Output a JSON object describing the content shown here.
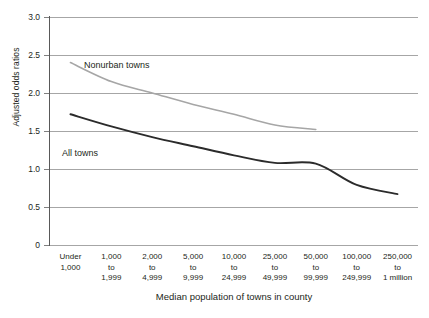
{
  "chart_data": {
    "type": "line",
    "title": "",
    "xlabel": "Median population of towns in county",
    "ylabel": "Adjusted odds ratios",
    "ylim": [
      0,
      3.0
    ],
    "y_ticks": [
      "0",
      "0.5",
      "1.0",
      "1.5",
      "2.0",
      "2.5",
      "3.0"
    ],
    "y_tick_values": [
      0,
      0.5,
      1.0,
      1.5,
      2.0,
      2.5,
      3.0
    ],
    "grid": true,
    "legend_position": "inline-labels",
    "categories": [
      "Under 1,000",
      "1,000 to 1,999",
      "2,000 to 4,999",
      "5,000 to 9,999",
      "10,000 to 24,999",
      "25,000 to 49,999",
      "50,000 to 99,999",
      "100,000 to 249,999",
      "250,000 to 1 million"
    ],
    "category_lines": [
      [
        "Under",
        "1,000",
        ""
      ],
      [
        "1,000",
        "to",
        "1,999"
      ],
      [
        "2,000",
        "to",
        "4,999"
      ],
      [
        "5,000",
        "to",
        "9,999"
      ],
      [
        "10,000",
        "to",
        "24,999"
      ],
      [
        "25,000",
        "to",
        "49,999"
      ],
      [
        "50,000",
        "to",
        "99,999"
      ],
      [
        "100,000",
        "to",
        "249,999"
      ],
      [
        "250,000",
        "to",
        "1 million"
      ]
    ],
    "series": [
      {
        "name": "Nonurban towns",
        "color": "#a6a6a6",
        "values": [
          2.4,
          2.15,
          2.0,
          1.85,
          1.72,
          1.58,
          1.52,
          null,
          null
        ]
      },
      {
        "name": "All towns",
        "color": "#2b2b2b",
        "values": [
          1.72,
          1.56,
          1.42,
          1.3,
          1.18,
          1.08,
          1.07,
          0.79,
          0.67
        ]
      }
    ]
  },
  "axes": {
    "y_title": "Adjusted odds ratios",
    "x_title": "Median population of towns in county"
  },
  "series_labels": {
    "nonurban": "Nonurban towns",
    "all_towns": "All towns"
  },
  "colors": {
    "nonurban": "#a6a6a6",
    "all_towns": "#2b2b2b",
    "grid": "#a6a6a6",
    "axis": "#595959",
    "text": "#231f20",
    "background": "#ffffff"
  }
}
